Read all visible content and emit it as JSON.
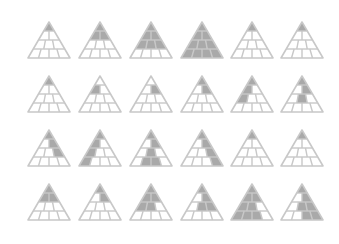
{
  "figure": {
    "colors": {
      "line": "#c8c8c8",
      "fill": "#a9a9a9",
      "background": "#ffffff"
    },
    "layout": {
      "columns_x": [
        49,
        100,
        151,
        202,
        252,
        302
      ],
      "rows_y": [
        22,
        76,
        130,
        184
      ],
      "half_width": 21,
      "height": 36
    }
  },
  "triangles": [
    {
      "row": 0,
      "col": 0,
      "cells": [
        [
          0,
          0
        ]
      ]
    },
    {
      "row": 0,
      "col": 1,
      "cells": [
        [
          0,
          0
        ],
        [
          1,
          0
        ],
        [
          1,
          1
        ]
      ]
    },
    {
      "row": 0,
      "col": 2,
      "cells": [
        [
          0,
          0
        ],
        [
          1,
          0
        ],
        [
          1,
          1
        ],
        [
          2,
          0
        ],
        [
          2,
          1
        ],
        [
          2,
          2
        ]
      ]
    },
    {
      "row": 0,
      "col": 3,
      "cells": [
        [
          0,
          0
        ],
        [
          1,
          0
        ],
        [
          1,
          1
        ],
        [
          2,
          0
        ],
        [
          2,
          1
        ],
        [
          2,
          2
        ],
        [
          3,
          0
        ],
        [
          3,
          1
        ],
        [
          3,
          2
        ],
        [
          3,
          3
        ]
      ]
    },
    {
      "row": 0,
      "col": 4,
      "cells": [
        [
          0,
          0
        ]
      ],
      "partial": "left-tip"
    },
    {
      "row": 0,
      "col": 5,
      "cells": [
        [
          0,
          0
        ]
      ],
      "partial": "center-tip"
    },
    {
      "row": 1,
      "col": 0,
      "cells": [
        [
          0,
          0
        ]
      ],
      "partial": "right-tip"
    },
    {
      "row": 1,
      "col": 1,
      "cells": [
        [
          1,
          0
        ]
      ]
    },
    {
      "row": 1,
      "col": 2,
      "cells": [
        [
          1,
          1
        ]
      ],
      "partial": "center"
    },
    {
      "row": 1,
      "col": 3,
      "cells": [
        [
          0,
          0
        ],
        [
          1,
          1
        ]
      ],
      "partial": "right-edge"
    },
    {
      "row": 1,
      "col": 4,
      "cells": [
        [
          0,
          0
        ],
        [
          1,
          0
        ],
        [
          2,
          0
        ]
      ],
      "partial": "left-edge"
    },
    {
      "row": 1,
      "col": 5,
      "cells": [
        [
          0,
          0
        ],
        [
          1,
          1
        ],
        [
          2,
          1
        ]
      ],
      "partial": "center-column"
    },
    {
      "row": 2,
      "col": 0,
      "cells": [
        [
          0,
          0
        ],
        [
          1,
          1
        ],
        [
          2,
          2
        ]
      ],
      "partial": "right-edge"
    },
    {
      "row": 2,
      "col": 1,
      "cells": [
        [
          0,
          0
        ],
        [
          1,
          0
        ],
        [
          2,
          0
        ],
        [
          3,
          0
        ]
      ],
      "partial": "left-edge"
    },
    {
      "row": 2,
      "col": 2,
      "cells": [
        [
          0,
          0
        ],
        [
          1,
          1
        ],
        [
          2,
          1
        ],
        [
          3,
          1
        ],
        [
          3,
          2
        ]
      ],
      "partial": "center-column"
    },
    {
      "row": 2,
      "col": 3,
      "cells": [
        [
          0,
          0
        ],
        [
          1,
          1
        ],
        [
          2,
          2
        ],
        [
          3,
          3
        ]
      ],
      "partial": "right-edge"
    },
    {
      "row": 2,
      "col": 4,
      "cells": [
        [
          0,
          0
        ]
      ],
      "partial": "left-tip"
    },
    {
      "row": 2,
      "col": 5,
      "cells": [
        [
          0,
          0
        ]
      ],
      "partial": "center-tip"
    },
    {
      "row": 3,
      "col": 0,
      "cells": [
        [
          0,
          0
        ],
        [
          1,
          0
        ],
        [
          1,
          1
        ]
      ]
    },
    {
      "row": 3,
      "col": 1,
      "cells": [
        [
          0,
          0
        ],
        [
          1,
          1
        ]
      ]
    },
    {
      "row": 3,
      "col": 2,
      "cells": [
        [
          0,
          0
        ],
        [
          1,
          0
        ],
        [
          1,
          1
        ],
        [
          2,
          0
        ],
        [
          2,
          1
        ]
      ]
    },
    {
      "row": 3,
      "col": 3,
      "cells": [
        [
          0,
          0
        ],
        [
          1,
          1
        ],
        [
          2,
          1
        ],
        [
          2,
          2
        ]
      ]
    },
    {
      "row": 3,
      "col": 4,
      "cells": [
        [
          0,
          0
        ],
        [
          1,
          0
        ],
        [
          1,
          1
        ],
        [
          2,
          0
        ],
        [
          2,
          1
        ],
        [
          3,
          0
        ],
        [
          3,
          1
        ],
        [
          3,
          2
        ]
      ]
    },
    {
      "row": 3,
      "col": 5,
      "cells": [
        [
          0,
          0
        ],
        [
          1,
          1
        ],
        [
          2,
          1
        ],
        [
          2,
          2
        ],
        [
          3,
          2
        ],
        [
          3,
          3
        ]
      ]
    }
  ]
}
